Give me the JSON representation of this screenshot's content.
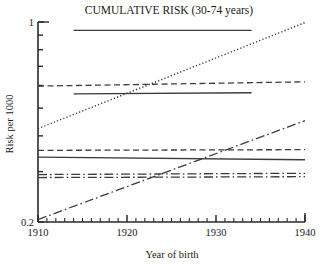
{
  "chart_data": {
    "type": "line",
    "title": "CUMULATIVE RISK (30-74 years)",
    "xlabel": "Year of birth",
    "ylabel": "Risk per 1000",
    "xlim": [
      1910,
      1940
    ],
    "ylim": [
      0.2,
      1.0
    ],
    "yscale": "log",
    "xscale": "linear",
    "grid": false,
    "legend": "none",
    "xticks": [
      1910,
      1920,
      1930,
      1940
    ],
    "xtick_labels": [
      "1910",
      "1920",
      "1930",
      "1940"
    ],
    "xminor_step": 1,
    "yticks": [
      0.2,
      0.3,
      0.4,
      0.5,
      0.6,
      0.7,
      0.8,
      0.9,
      1.0
    ],
    "ytick_labels": [
      "0.2",
      "",
      "",
      "",
      "",
      "",
      "",
      "",
      "1"
    ],
    "ytick_labeled": [
      0.2,
      1.0
    ],
    "series": [
      {
        "name": "series-1-top-solid",
        "style": "solid",
        "x": [
          1914,
          1934
        ],
        "y": [
          0.935,
          0.935
        ]
      },
      {
        "name": "series-2-dashed-upper",
        "style": "dashed",
        "x": [
          1910,
          1940
        ],
        "y": [
          0.597,
          0.618
        ]
      },
      {
        "name": "series-3-solid-mid",
        "style": "solid",
        "x": [
          1914,
          1934
        ],
        "y": [
          0.561,
          0.566
        ]
      },
      {
        "name": "series-4-dotted-rising",
        "style": "dotted",
        "x": [
          1910,
          1940
        ],
        "y": [
          0.424,
          0.995
        ]
      },
      {
        "name": "series-5-dashed-lower",
        "style": "dashed",
        "x": [
          1910,
          1940
        ],
        "y": [
          0.356,
          0.358
        ]
      },
      {
        "name": "series-6-solid-lower",
        "style": "solid",
        "x": [
          1910,
          1940
        ],
        "y": [
          0.337,
          0.33
        ]
      },
      {
        "name": "series-7-dashdot-flat-a",
        "style": "dashdot",
        "x": [
          1910,
          1940
        ],
        "y": [
          0.293,
          0.296
        ]
      },
      {
        "name": "series-8-dashdot-flat-b",
        "style": "dashdot",
        "x": [
          1910,
          1940
        ],
        "y": [
          0.286,
          0.288
        ]
      },
      {
        "name": "series-9-dashdot-rising",
        "style": "dashdot",
        "x": [
          1910,
          1940
        ],
        "y": [
          0.204,
          0.452
        ]
      }
    ],
    "line_color": "#3c3c3c"
  },
  "figure": {
    "background": "#ffffff",
    "axis_color": "#2a2a2a"
  }
}
